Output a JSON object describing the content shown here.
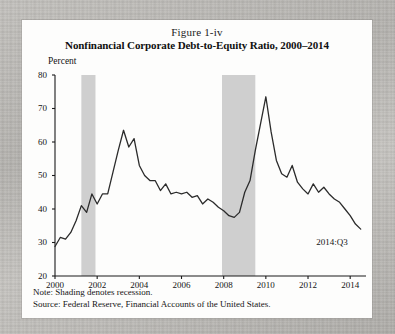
{
  "figure": {
    "number": "Figure 1-iv",
    "title": "Nonfinancial Corporate Debt-to-Equity Ratio, 2000–2014",
    "y_axis_title": "Percent",
    "endpoint_label": "2014:Q3",
    "note": "Note: Shading denotes recession.",
    "source": "Source: Federal Reserve, Financial Accounts of the United States."
  },
  "colors": {
    "panel_background": "#fdfdfc",
    "page_background": "#b9b7b3",
    "line": "#2b2b2b",
    "axis": "#1a1a1a",
    "recession_shading": "#cfcfcf",
    "text": "#141414"
  },
  "chart_data": {
    "type": "line",
    "title": "Nonfinancial Corporate Debt-to-Equity Ratio, 2000–2014",
    "subtitle": "Figure 1-iv",
    "xlabel": "",
    "ylabel": "Percent",
    "xlim": [
      2000.0,
      2014.75
    ],
    "ylim": [
      20,
      80
    ],
    "yticks": [
      20,
      30,
      40,
      50,
      60,
      70,
      80
    ],
    "xticks": [
      2000,
      2002,
      2004,
      2006,
      2008,
      2010,
      2012,
      2014
    ],
    "grid": false,
    "legend": null,
    "annotations": [
      {
        "text": "2014:Q3",
        "x": 2014.0,
        "y": 30.0
      }
    ],
    "shaded_regions": [
      {
        "label": "recession",
        "x0": 2001.25,
        "x1": 2001.92,
        "color": "#cfcfcf"
      },
      {
        "label": "recession",
        "x0": 2007.92,
        "x1": 2009.5,
        "color": "#cfcfcf"
      }
    ],
    "series": [
      {
        "name": "Debt-to-Equity Ratio",
        "x": [
          2000.0,
          2000.25,
          2000.5,
          2000.75,
          2001.0,
          2001.25,
          2001.5,
          2001.75,
          2002.0,
          2002.25,
          2002.5,
          2002.75,
          2003.0,
          2003.25,
          2003.5,
          2003.75,
          2004.0,
          2004.25,
          2004.5,
          2004.75,
          2005.0,
          2005.25,
          2005.5,
          2005.75,
          2006.0,
          2006.25,
          2006.5,
          2006.75,
          2007.0,
          2007.25,
          2007.5,
          2007.75,
          2008.0,
          2008.25,
          2008.5,
          2008.75,
          2009.0,
          2009.25,
          2009.5,
          2009.75,
          2010.0,
          2010.25,
          2010.5,
          2010.75,
          2011.0,
          2011.25,
          2011.5,
          2011.75,
          2012.0,
          2012.25,
          2012.5,
          2012.75,
          2013.0,
          2013.25,
          2013.5,
          2013.75,
          2014.0,
          2014.25,
          2014.5
        ],
        "values": [
          28.8,
          31.5,
          31.0,
          33.0,
          36.5,
          41.0,
          39.0,
          44.5,
          41.5,
          44.5,
          44.5,
          51.0,
          57.5,
          63.5,
          58.5,
          61.0,
          53.0,
          50.0,
          48.5,
          48.5,
          45.5,
          47.5,
          44.5,
          45.0,
          44.5,
          45.0,
          43.5,
          44.0,
          41.5,
          43.0,
          42.0,
          40.5,
          39.5,
          38.0,
          37.5,
          39.0,
          45.0,
          48.5,
          57.5,
          65.5,
          73.5,
          63.0,
          54.5,
          50.5,
          49.5,
          53.0,
          48.0,
          46.0,
          44.5,
          47.5,
          45.0,
          46.5,
          44.5,
          43.0,
          42.0,
          40.0,
          38.0,
          35.5,
          34.0
        ],
        "color": "#2b2b2b",
        "linewidth": 1.3
      }
    ]
  }
}
